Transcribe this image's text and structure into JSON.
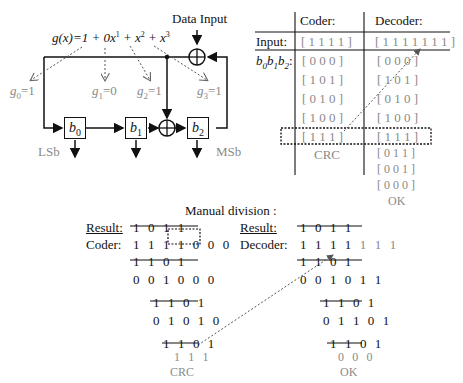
{
  "circuit": {
    "data_input_label": "Data Input",
    "polynomial": {
      "prefix": "g(x)=1 + 0x",
      "exp1": "1",
      "plus_x": " + x",
      "exp2": "2",
      "plus_x3": " + x",
      "exp3": "3"
    },
    "coefficients": [
      {
        "name": "g",
        "sub": "0",
        "value": "=1"
      },
      {
        "name": "g",
        "sub": "1",
        "value": "=0"
      },
      {
        "name": "g",
        "sub": "2",
        "value": "=1"
      },
      {
        "name": "g",
        "sub": "3",
        "value": "=1"
      }
    ],
    "registers": [
      {
        "name": "b",
        "sub": "0"
      },
      {
        "name": "b",
        "sub": "1"
      },
      {
        "name": "b",
        "sub": "2"
      }
    ],
    "lsb_label": "LSb",
    "msb_label": "MSb"
  },
  "table": {
    "headers": {
      "coder": "Coder:",
      "decoder": "Decoder:"
    },
    "input_label": "Input:",
    "state_label": {
      "b0": "b",
      "s0": "0",
      "b1": "b",
      "s1": "1",
      "b2": "b",
      "s2": "2",
      "colon": ":"
    },
    "coder_input": "[ 1 1 1 1 ]",
    "decoder_input": "[ 1 1 1 1 1 1 1 ]",
    "coder_states": [
      "[ 0 0 0 ]",
      "[ 1 0 1 ]",
      "[ 0 1 0 ]",
      "[ 1 0 0 ]",
      "[ 1 1 1 ]"
    ],
    "decoder_states": [
      "[ 0 0 0 ]",
      "[ 1 0 1 ]",
      "[ 0 1 0 ]",
      "[ 1 0 0 ]",
      "[ 1 1 1 ]",
      "[ 0 1 1 ]",
      "[ 0 0 1 ]",
      "[ 0 0 0 ]"
    ],
    "coder_footer": "CRC",
    "decoder_footer": "OK"
  },
  "division": {
    "title": "Manual division :",
    "coder": {
      "result_label": "Result:",
      "result": "1 0 1 1",
      "row_label": "Coder:",
      "dividend_data": "1 1 1 1",
      "dividend_pad": "0 0 0",
      "steps": [
        "1 1 0 1",
        "0 0 1 0 0 0",
        "1 1 0 1",
        "0 1 0 1 0",
        "1 1 0 1"
      ],
      "remainder": "1 1 1",
      "footer": "CRC"
    },
    "decoder": {
      "result_label": "Result:",
      "result": "1 0 1 1",
      "row_label": "Decoder:",
      "dividend_data": "1 1 1 1",
      "dividend_crc": "1 1 1",
      "steps": [
        "1 1 0 1",
        "0 0 1 0 1 1",
        "1 1 0 1",
        "0 1 1 0 1",
        "1 1 0 1"
      ],
      "remainder": "0 0 0",
      "footer": "OK"
    }
  }
}
